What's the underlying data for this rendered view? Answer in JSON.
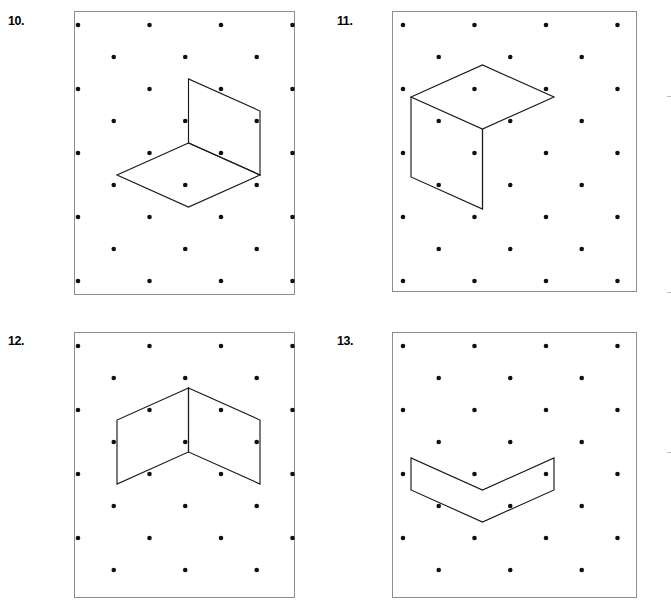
{
  "page": {
    "background_color": "#ffffff",
    "width": 671,
    "height": 610
  },
  "style": {
    "box_border_color": "#8e8e8e",
    "dot_color": "#111111",
    "figure_line_color": "#1a1a1a",
    "label_color": "#000000"
  },
  "grid": {
    "description": "isometric (triangular) dot lattice",
    "dx": 71.5,
    "dy": 32,
    "dot_radius": 2.3,
    "row_offset": 35.75
  },
  "problems": [
    {
      "number": "10.",
      "label_name": "problem-label-10",
      "label_x": 8,
      "label_y": 14,
      "box": {
        "x": 74,
        "y": 11,
        "width": 221,
        "height": 284
      },
      "dot_origin": {
        "x": 3,
        "y": 13
      },
      "dot_rows": 10,
      "dot_cols": 4,
      "figure": {
        "name": "open-box-corner",
        "paths": [
          "M 110.5 118 L 110.5 54 L 182 86 L 182 150 Z",
          "M 110.5 118 L 39 150 L 110.5 182 L 182 150 Z"
        ]
      }
    },
    {
      "number": "11.",
      "label_name": "problem-label-11",
      "label_x": 337,
      "label_y": 14,
      "box": {
        "x": 392,
        "y": 11,
        "width": 245,
        "height": 281
      },
      "dot_origin": {
        "x": 10,
        "y": 13
      },
      "dot_rows": 10,
      "dot_cols": 4,
      "figure": {
        "name": "cube-outline",
        "paths": [
          "M 8 72 L 79.5 40 L 151 72 L 79.5 104 Z",
          "M 8 72 L 8 152 L 79.5 184 L 79.5 104",
          "M 79.5 104 L 79.5 184"
        ]
      }
    },
    {
      "number": "12.",
      "label_name": "problem-label-12",
      "label_x": 8,
      "label_y": 334,
      "box": {
        "x": 74,
        "y": 332,
        "width": 221,
        "height": 266
      },
      "dot_origin": {
        "x": 3,
        "y": 13
      },
      "dot_rows": 9,
      "dot_cols": 4,
      "figure": {
        "name": "vee-walls",
        "paths": [
          "M 110.5 42 L 39 74 L 39 138 L 110.5 106 Z",
          "M 110.5 42 L 182 74 L 182 138 L 110.5 106 Z"
        ]
      }
    },
    {
      "number": "13.",
      "label_name": "problem-label-13",
      "label_x": 337,
      "label_y": 334,
      "box": {
        "x": 392,
        "y": 332,
        "width": 245,
        "height": 266
      },
      "dot_origin": {
        "x": 10,
        "y": 13
      },
      "dot_rows": 9,
      "dot_cols": 4,
      "figure": {
        "name": "chevron-band",
        "paths": [
          "M 8 112 L 8 144 L 79.5 176 L 151 144 L 151 112 L 79.5 144 Z"
        ]
      }
    }
  ]
}
